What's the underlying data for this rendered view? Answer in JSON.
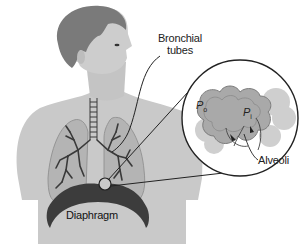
{
  "diagram": {
    "labels": {
      "bronchial_line1": "Bronchial",
      "bronchial_line2": "tubes",
      "alveoli": "Alveoli",
      "diaphragm": "Diaphragm",
      "p_outside": "P",
      "p_outside_sub": "o",
      "p_inside": "P",
      "p_inside_sub": "i"
    },
    "colors": {
      "skin": "#c9c9c9",
      "hair": "#7a7a7a",
      "lung": "#b4b4b4",
      "lung_outline": "#8a8a8a",
      "bronchi": "#3a3a3a",
      "diaphragm": "#3c3c3c",
      "line": "#222222",
      "alveoli_fill": "#a9a9a9",
      "alveoli_halo": "#cfcfcf"
    }
  }
}
